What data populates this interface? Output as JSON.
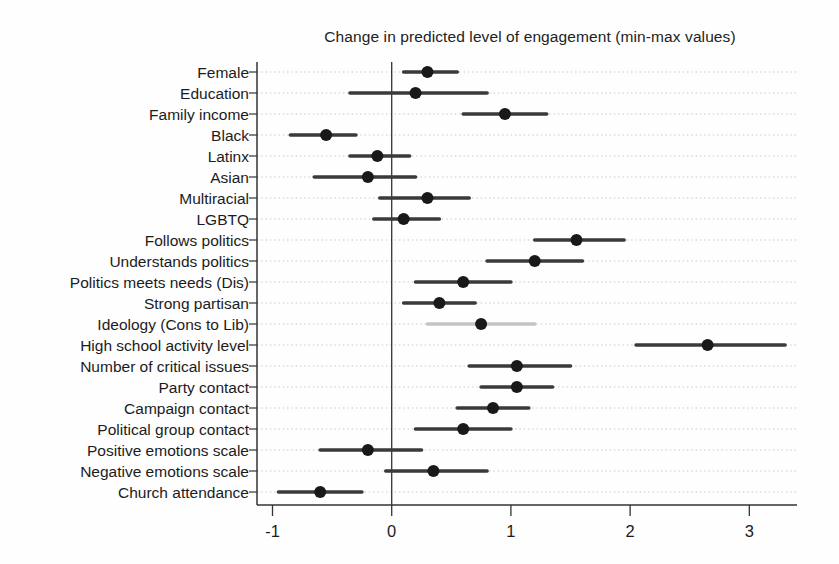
{
  "chart_data": {
    "type": "scatter",
    "subtype": "dot-and-whisker coefficient plot",
    "title": "Change in predicted level of engagement (min-max values)",
    "xlabel": "",
    "ylabel": "",
    "xlim": [
      -1.13,
      3.4
    ],
    "x_ticks": [
      -1,
      0,
      1,
      2,
      3
    ],
    "x_tick_labels": [
      "-1",
      "0",
      "1",
      "2",
      "3"
    ],
    "zero_reference_line": 0,
    "grid": "horizontal-dotted",
    "legend": "none",
    "categories": [
      "Female",
      "Education",
      "Family income",
      "Black",
      "Latinx",
      "Asian",
      "Multiracial",
      "LGBTQ",
      "Follows politics",
      "Understands politics",
      "Politics meets needs (Dis)",
      "Strong partisan",
      "Ideology (Cons to Lib)",
      "High school activity level",
      "Number of critical issues",
      "Party contact",
      "Campaign contact",
      "Political group contact",
      "Positive emotions scale",
      "Negative emotions scale",
      "Church attendance"
    ],
    "points": [
      {
        "label": "Female",
        "estimate": 0.3,
        "low": 0.1,
        "high": 0.55,
        "muted_ci": false
      },
      {
        "label": "Education",
        "estimate": 0.2,
        "low": -0.35,
        "high": 0.8,
        "muted_ci": false
      },
      {
        "label": "Family income",
        "estimate": 0.95,
        "low": 0.6,
        "high": 1.3,
        "muted_ci": false
      },
      {
        "label": "Black",
        "estimate": -0.55,
        "low": -0.85,
        "high": -0.3,
        "muted_ci": false
      },
      {
        "label": "Latinx",
        "estimate": -0.12,
        "low": -0.35,
        "high": 0.15,
        "muted_ci": false
      },
      {
        "label": "Asian",
        "estimate": -0.2,
        "low": -0.65,
        "high": 0.2,
        "muted_ci": false
      },
      {
        "label": "Multiracial",
        "estimate": 0.3,
        "low": -0.1,
        "high": 0.65,
        "muted_ci": false
      },
      {
        "label": "LGBTQ",
        "estimate": 0.1,
        "low": -0.15,
        "high": 0.4,
        "muted_ci": false
      },
      {
        "label": "Follows politics",
        "estimate": 1.55,
        "low": 1.2,
        "high": 1.95,
        "muted_ci": false
      },
      {
        "label": "Understands politics",
        "estimate": 1.2,
        "low": 0.8,
        "high": 1.6,
        "muted_ci": false
      },
      {
        "label": "Politics meets needs (Dis)",
        "estimate": 0.6,
        "low": 0.2,
        "high": 1.0,
        "muted_ci": false
      },
      {
        "label": "Strong partisan",
        "estimate": 0.4,
        "low": 0.1,
        "high": 0.7,
        "muted_ci": false
      },
      {
        "label": "Ideology (Cons to Lib)",
        "estimate": 0.75,
        "low": 0.3,
        "high": 1.2,
        "muted_ci": true
      },
      {
        "label": "High school activity level",
        "estimate": 2.65,
        "low": 2.05,
        "high": 3.3,
        "muted_ci": false
      },
      {
        "label": "Number of critical issues",
        "estimate": 1.05,
        "low": 0.65,
        "high": 1.5,
        "muted_ci": false
      },
      {
        "label": "Party contact",
        "estimate": 1.05,
        "low": 0.75,
        "high": 1.35,
        "muted_ci": false
      },
      {
        "label": "Campaign contact",
        "estimate": 0.85,
        "low": 0.55,
        "high": 1.15,
        "muted_ci": false
      },
      {
        "label": "Political group contact",
        "estimate": 0.6,
        "low": 0.2,
        "high": 1.0,
        "muted_ci": false
      },
      {
        "label": "Positive emotions scale",
        "estimate": -0.2,
        "low": -0.6,
        "high": 0.25,
        "muted_ci": false
      },
      {
        "label": "Negative emotions scale",
        "estimate": 0.35,
        "low": -0.05,
        "high": 0.8,
        "muted_ci": false
      },
      {
        "label": "Church attendance",
        "estimate": -0.6,
        "low": -0.95,
        "high": -0.25,
        "muted_ci": false
      }
    ],
    "colors": {
      "dot": "#191919",
      "ci_line": "#3a3a3a",
      "ci_line_muted": "#c4c4c4",
      "gridline": "#c9c9c9",
      "axis": "#333333",
      "text": "#1c1c1c",
      "background": "#fefefe"
    }
  }
}
